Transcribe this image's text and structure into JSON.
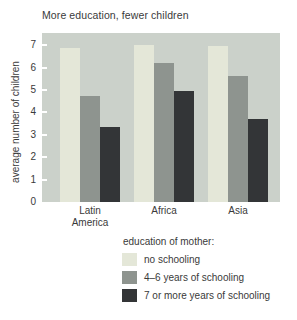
{
  "chart_data": {
    "type": "bar",
    "title": "More education, fewer children",
    "ylabel": "average number of children",
    "categories": [
      "Latin America",
      "Africa",
      "Asia"
    ],
    "series": [
      {
        "name": "no schooling",
        "color": "#e4e7d8",
        "values": [
          6.9,
          7.0,
          6.95
        ]
      },
      {
        "name": "4–6 years of schooling",
        "color": "#8e948f",
        "values": [
          4.75,
          6.2,
          5.65
        ]
      },
      {
        "name": "7 or more years of schooling",
        "color": "#333537",
        "values": [
          3.35,
          4.95,
          3.7
        ]
      }
    ],
    "ylim": [
      0,
      7.55
    ],
    "yticks": [
      0,
      1,
      2,
      3,
      4,
      5,
      6,
      7
    ],
    "grid": false,
    "legend_title": "education of mother:",
    "legend_position": "bottom-right",
    "plot_bg": "#cbd1ca",
    "tick_color": "#ffffff",
    "text_color": "#3a3a3a"
  }
}
